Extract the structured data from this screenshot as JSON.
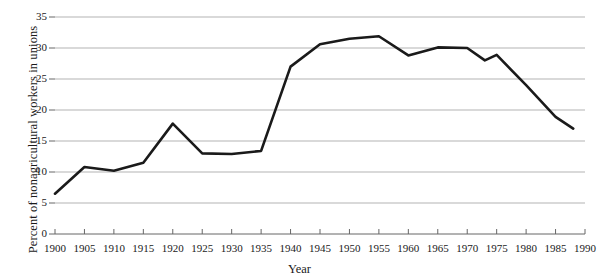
{
  "chart_data": {
    "type": "line",
    "title": "",
    "subtitle": "",
    "xlabel": "Year",
    "ylabel": "Percent of nonagricultural workers in unions",
    "xlim": [
      1900,
      1990
    ],
    "ylim": [
      0,
      35
    ],
    "grid": true,
    "grid_axis": "y",
    "legend": false,
    "legend_position": "none",
    "line_color": "#1a1a1a",
    "grid_color": "#b3b3b3",
    "axis_color": "#555555",
    "xticks": [
      1900,
      1905,
      1910,
      1915,
      1920,
      1925,
      1930,
      1935,
      1940,
      1945,
      1950,
      1955,
      1960,
      1965,
      1970,
      1975,
      1980,
      1985,
      1990
    ],
    "xtick_labels": [
      "1900",
      "1905",
      "1910",
      "1915",
      "1920",
      "1925",
      "1930",
      "1935",
      "1940",
      "1945",
      "1950",
      "1955",
      "1960",
      "1965",
      "1970",
      "1975",
      "1980",
      "1985",
      "1990"
    ],
    "yticks": [
      0,
      5,
      10,
      15,
      20,
      25,
      30,
      35
    ],
    "ytick_labels": [
      "0",
      "5",
      "10",
      "15",
      "20",
      "25",
      "30",
      "35"
    ],
    "x": [
      1900,
      1905,
      1910,
      1915,
      1920,
      1925,
      1930,
      1935,
      1940,
      1945,
      1950,
      1955,
      1960,
      1965,
      1970,
      1973,
      1975,
      1980,
      1985,
      1988
    ],
    "values": [
      6.5,
      10.8,
      10.2,
      11.5,
      17.8,
      13.0,
      12.9,
      13.4,
      27.0,
      30.6,
      31.5,
      31.9,
      28.8,
      30.1,
      30.0,
      28.0,
      28.9,
      24.0,
      18.9,
      17.0
    ],
    "series": [
      {
        "name": "Union membership",
        "values": [
          6.5,
          10.8,
          10.2,
          11.5,
          17.8,
          13.0,
          12.9,
          13.4,
          27.0,
          30.6,
          31.5,
          31.9,
          28.8,
          30.1,
          30.0,
          28.0,
          28.9,
          24.0,
          18.9,
          17.0
        ]
      }
    ]
  }
}
